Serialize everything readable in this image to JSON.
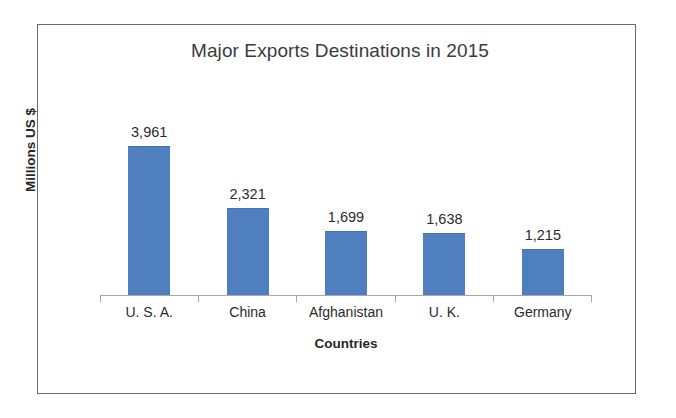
{
  "figure": {
    "border_color": "#6a6a6a",
    "background": "#ffffff"
  },
  "chart_data": {
    "type": "bar",
    "title": "Major Exports Destinations in 2015",
    "xlabel": "Countries",
    "ylabel": "Millions US $",
    "categories": [
      "U. S. A.",
      "China",
      "Afghanistan",
      "U. K.",
      "Germany"
    ],
    "values": [
      3961,
      2321,
      1699,
      1638,
      1215
    ],
    "value_labels": [
      "3,961",
      "2,321",
      "1,699",
      "1,638",
      "1,215"
    ],
    "series": [
      {
        "name": "Exports",
        "values": [
          3961,
          2321,
          1699,
          1638,
          1215
        ],
        "color": "#4F7FBF"
      }
    ],
    "ylim": [
      0,
      5450
    ],
    "grid": false,
    "legend": false,
    "y_axis_ticks_visible": false,
    "x_axis_line_color": "#a6a6a6",
    "data_labels_shown": true
  }
}
